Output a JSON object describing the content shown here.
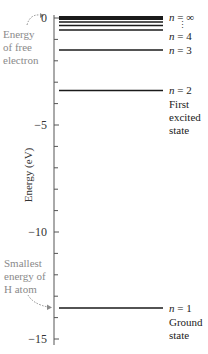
{
  "axis": {
    "label": "Energy (eV)",
    "ticks": [
      {
        "value": 0,
        "label": "0"
      },
      {
        "value": -5,
        "label": "−5"
      },
      {
        "value": -10,
        "label": "−10"
      },
      {
        "value": -15,
        "label": "−15"
      }
    ],
    "range": [
      -15.3,
      0
    ],
    "minor_tick_step": 1
  },
  "levels": [
    {
      "n": "1",
      "energy": -13.6,
      "label": "n = 1",
      "caption": [
        "Ground",
        "state"
      ]
    },
    {
      "n": "2",
      "energy": -3.4,
      "label": "n = 2",
      "caption": [
        "First",
        "excited",
        "state"
      ]
    },
    {
      "n": "3",
      "energy": -1.51,
      "label": "n = 3"
    },
    {
      "n": "4",
      "energy": -0.85,
      "label": "n = 4"
    },
    {
      "n": "5",
      "energy": -0.54
    },
    {
      "n": "6",
      "energy": -0.38
    },
    {
      "n": "∞",
      "energy": 0,
      "label": "n = ∞"
    }
  ],
  "annotations": {
    "free_electron": [
      "Energy",
      "of free",
      "electron"
    ],
    "smallest_energy": [
      "Smallest",
      "energy of",
      "H atom"
    ],
    "ellipsis": "⋮"
  },
  "labels": {
    "n_inf_var": "n",
    "n_inf_rest": " = ∞",
    "n4_var": "n",
    "n4_rest": " = 4",
    "n3_var": "n",
    "n3_rest": " = 3",
    "n2_var": "n",
    "n2_rest": " = 2",
    "n1_var": "n",
    "n1_rest": " = 1"
  },
  "colors": {
    "lines": "#1a1a1a",
    "axis": "#555555",
    "annotation": "#8a8a8a"
  }
}
